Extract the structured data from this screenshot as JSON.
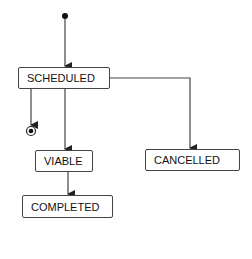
{
  "diagram": {
    "type": "state-machine",
    "initial_state": "SCHEDULED",
    "states": [
      {
        "id": "scheduled",
        "label": "SCHEDULED"
      },
      {
        "id": "viable",
        "label": "VIABLE"
      },
      {
        "id": "cancelled",
        "label": "CANCELLED"
      },
      {
        "id": "completed",
        "label": "COMPLETED"
      }
    ],
    "transitions": [
      {
        "from": "initial",
        "to": "SCHEDULED"
      },
      {
        "from": "SCHEDULED",
        "to": "final"
      },
      {
        "from": "SCHEDULED",
        "to": "VIABLE"
      },
      {
        "from": "SCHEDULED",
        "to": "CANCELLED"
      },
      {
        "from": "VIABLE",
        "to": "COMPLETED"
      }
    ],
    "colors": {
      "line": "#444444",
      "text": "#111111",
      "background": "#ffffff"
    }
  }
}
